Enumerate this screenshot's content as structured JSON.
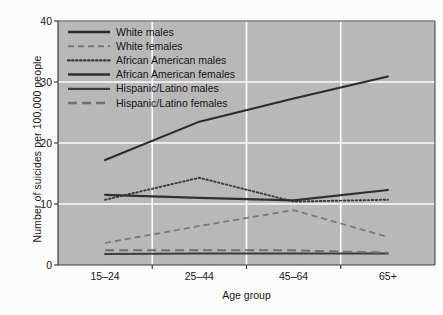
{
  "chart_data": {
    "type": "line",
    "title": "",
    "xlabel": "Age group",
    "ylabel": "Number of suicides per 100,000 people",
    "categories": [
      "15–24",
      "25–44",
      "45–64",
      "65+"
    ],
    "yticks": [
      0,
      10,
      20,
      30,
      40
    ],
    "ylim": [
      0,
      40
    ],
    "grid": "horizontal-and-vertical-white",
    "legend_position": "top-left-inside",
    "background_color": "#b9b9b9",
    "gridline_color": "#ffffff",
    "axis_color": "#3c3c3c",
    "series": [
      {
        "name": "White males",
        "style": "solid",
        "color": "#2b2b2b",
        "width": 2.1,
        "values": [
          17.2,
          23.5,
          27.3,
          30.9
        ]
      },
      {
        "name": "White females",
        "style": "dashed",
        "color": "#7a7a7a",
        "width": 1.8,
        "values": [
          3.6,
          6.4,
          9.0,
          4.6
        ]
      },
      {
        "name": "African American males",
        "style": "dotted",
        "color": "#3a3a3a",
        "width": 1.9,
        "values": [
          10.7,
          14.3,
          10.4,
          10.7
        ]
      },
      {
        "name": "African American females",
        "style": "solid",
        "color": "#2f2f2f",
        "width": 2.2,
        "values": [
          11.5,
          11.0,
          10.6,
          12.3
        ]
      },
      {
        "name": "Hispanic/Latino males",
        "style": "solid",
        "color": "#3a3a3a",
        "width": 2.0,
        "values": [
          1.8,
          1.9,
          1.9,
          1.9
        ]
      },
      {
        "name": "Hispanic/Latino females",
        "style": "long-dashed",
        "color": "#6f6f6f",
        "width": 2.0,
        "values": [
          2.4,
          2.4,
          2.4,
          2.0
        ]
      }
    ]
  },
  "axes": {
    "ytick_labels": [
      "0",
      "10",
      "20",
      "30",
      "40"
    ],
    "xtick_labels": [
      "15–24",
      "25–44",
      "45–64",
      "65+"
    ],
    "ylabel": "Number of suicides per 100,000 people",
    "xlabel": "Age group"
  },
  "legend": {
    "items": [
      {
        "label": "White males",
        "style": "solid"
      },
      {
        "label": "White females",
        "style": "dashed"
      },
      {
        "label": "African American males",
        "style": "dotted"
      },
      {
        "label": "African American females",
        "style": "solid"
      },
      {
        "label": "Hispanic/Latino males",
        "style": "solid"
      },
      {
        "label": "Hispanic/Latino females",
        "style": "long-dashed"
      }
    ]
  }
}
